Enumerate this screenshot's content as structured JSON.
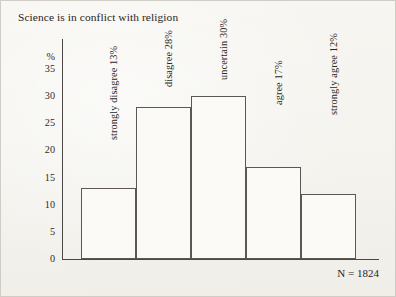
{
  "figure": {
    "title": "Science is in conflict with religion",
    "sample_size_label": "N = 1824",
    "y_axis_unit": "%"
  },
  "chart_data": {
    "type": "bar",
    "title": "Science is in conflict with religion",
    "xlabel": "",
    "ylabel": "%",
    "ylim": [
      0,
      35
    ],
    "ytick_labels": [
      "35",
      "30",
      "25",
      "20",
      "15",
      "10",
      "5",
      "0"
    ],
    "yticks": [
      35,
      30,
      25,
      20,
      15,
      10,
      5,
      0
    ],
    "grid": false,
    "legend": "none",
    "categories": [
      "strongly disagree",
      "disagree",
      "uncertain",
      "agree",
      "strongly agree"
    ],
    "values": [
      13,
      28,
      30,
      17,
      12
    ],
    "bar_labels": [
      "strongly disagree 13%",
      "disagree 28%",
      "uncertain 30%",
      "agree 17%",
      "strongly agree 12%"
    ],
    "annotations": [
      "N = 1824"
    ],
    "n": 1824
  }
}
